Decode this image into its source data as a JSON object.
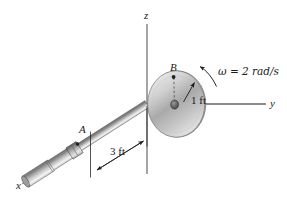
{
  "figure": {
    "background_color": "#ffffff",
    "ink_color": "#1a1a1a",
    "metal_light": "#e6e6e6",
    "metal_mid": "#b0b0b0",
    "metal_dark": "#6e6e6e",
    "disk_light": "#dcdcdc",
    "disk_mid": "#a8a8a8",
    "disk_dark": "#8a8a8a"
  },
  "axes": {
    "x": {
      "label": "x",
      "style": "dashed",
      "direction": "lower-left"
    },
    "y": {
      "label": "y",
      "style": "solid",
      "direction": "right"
    },
    "z": {
      "label": "z",
      "style": "solid",
      "direction": "up"
    }
  },
  "points": [
    {
      "name": "A",
      "label": "A",
      "description": "bearing on shaft"
    },
    {
      "name": "B",
      "label": "B",
      "description": "point on disk rim edge"
    }
  ],
  "dimensions": [
    {
      "name": "disk-radius",
      "label": "1 ft",
      "value": 1,
      "unit": "ft"
    },
    {
      "name": "shaft-length-A-to-origin",
      "label": "3 ft",
      "value": 3,
      "unit": "ft"
    }
  ],
  "annotations": {
    "angular_velocity": {
      "symbol": "ω",
      "equals": " = ",
      "value": "2 rad/s",
      "full_label": "ω = 2 rad/s",
      "sense": "counterclockwise about y-axis"
    }
  }
}
